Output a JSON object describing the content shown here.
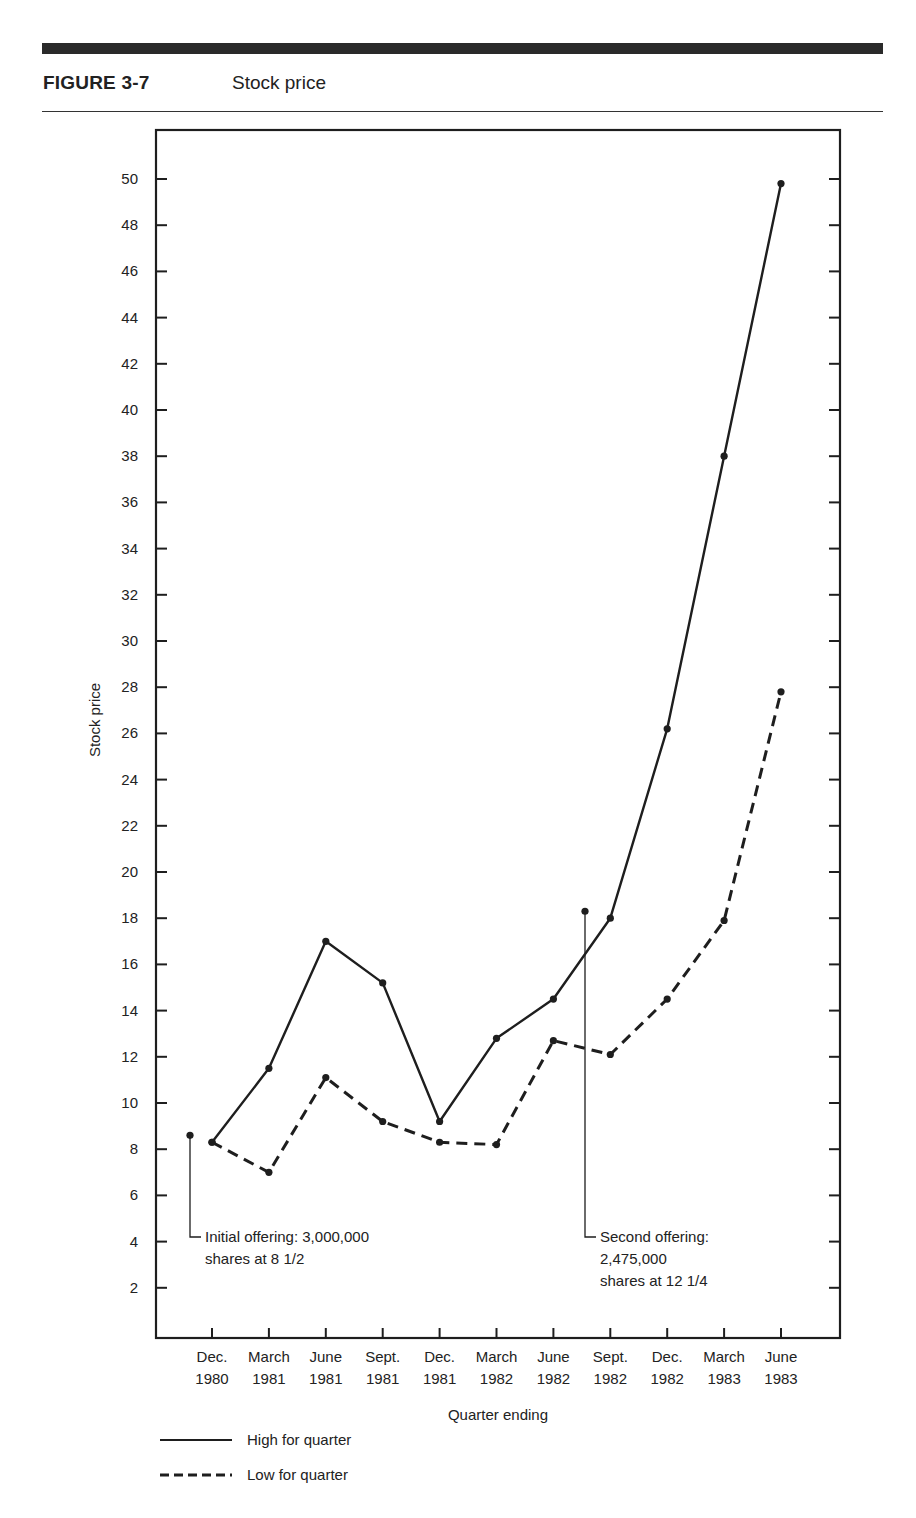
{
  "header": {
    "figure_label": "FIGURE 3-7",
    "figure_title": "Stock price"
  },
  "chart_data": {
    "type": "line",
    "title": "Stock price",
    "figure_label": "FIGURE 3-7",
    "xlabel": "Quarter ending",
    "ylabel": "Stock price",
    "ylim": [
      0,
      52
    ],
    "yticks": [
      2,
      4,
      6,
      8,
      10,
      12,
      14,
      16,
      18,
      20,
      22,
      24,
      26,
      28,
      30,
      32,
      34,
      36,
      38,
      40,
      42,
      44,
      46,
      48,
      50
    ],
    "grid": false,
    "categories": [
      [
        "Dec.",
        "1980"
      ],
      [
        "March",
        "1981"
      ],
      [
        "June",
        "1981"
      ],
      [
        "Sept.",
        "1981"
      ],
      [
        "Dec.",
        "1981"
      ],
      [
        "March",
        "1982"
      ],
      [
        "June",
        "1982"
      ],
      [
        "Sept.",
        "1982"
      ],
      [
        "Dec.",
        "1982"
      ],
      [
        "March",
        "1983"
      ],
      [
        "June",
        "1983"
      ]
    ],
    "series": [
      {
        "name": "High for quarter",
        "style": "solid",
        "values": [
          8.3,
          11.5,
          17.0,
          15.2,
          9.2,
          12.8,
          14.5,
          18.0,
          26.2,
          38.0,
          49.8
        ]
      },
      {
        "name": "Low for quarter",
        "style": "dashed",
        "values": [
          8.3,
          7.0,
          11.1,
          9.2,
          8.3,
          8.2,
          12.7,
          12.1,
          14.5,
          17.9,
          27.8
        ]
      }
    ],
    "annotations": [
      {
        "id": "initial-offering",
        "x_index": -0.4,
        "value": 8.6,
        "lines": [
          "Initial offering: 3,000,000",
          "shares at 8 1/2"
        ]
      },
      {
        "id": "second-offering",
        "x_index": 6.55,
        "value": 18.3,
        "lines": [
          "Second offering:",
          "2,475,000",
          "shares at 12 1/4"
        ]
      }
    ],
    "legend": {
      "position": "bottom-left",
      "entries": [
        {
          "label": "High for quarter",
          "style": "solid"
        },
        {
          "label": "Low for quarter",
          "style": "dashed"
        }
      ]
    },
    "colors": {
      "ink": "#1e1e1e"
    }
  }
}
